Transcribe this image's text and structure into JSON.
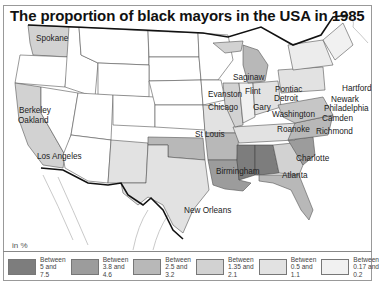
{
  "title": "The proportion of black mayors in the USA in 1985",
  "unit_label": "in %",
  "colors": {
    "c1": "#7d7d7d",
    "c2": "#9c9c9c",
    "c3": "#b8b8b8",
    "c4": "#d2d2d2",
    "c5": "#e2e2e2",
    "c6": "#f1f1f1"
  },
  "legend": [
    {
      "line1": "Between",
      "line2": "5 and",
      "line3": "7.5",
      "color": "#7d7d7d"
    },
    {
      "line1": "Between",
      "line2": "3.8 and",
      "line3": "4.6",
      "color": "#9c9c9c"
    },
    {
      "line1": "Between",
      "line2": "2.5 and",
      "line3": "3.2",
      "color": "#b8b8b8"
    },
    {
      "line1": "Between",
      "line2": "1.35 and",
      "line3": "2.1",
      "color": "#d2d2d2"
    },
    {
      "line1": "Between",
      "line2": "0.5 and",
      "line3": "1.1",
      "color": "#e2e2e2"
    },
    {
      "line1": "Between",
      "line2": "0.17 and",
      "line3": "0.2",
      "color": "#f1f1f1"
    }
  ],
  "cities": {
    "spokane": "Spokane",
    "berkeley": "Berkeley",
    "oakland": "Oakland",
    "los_angeles": "Los Angeles",
    "saginaw": "Saginaw",
    "flint": "Flint",
    "pontiac": "Pontiac",
    "detroit": "Detroit",
    "evanston": "Evanston",
    "chicago": "Chicago",
    "gary": "Gary",
    "st_louis": "St Louis",
    "hartford": "Hartford",
    "newark": "Newark",
    "philadelphia": "Philadelphia",
    "washington": "Washington",
    "camden": "Camden",
    "roanoke": "Roanoke",
    "richmond": "Richmond",
    "charlotte": "Charlotte",
    "birmingham": "Birmingham",
    "atlanta": "Atlanta",
    "new_orleans": "New Orleans"
  }
}
